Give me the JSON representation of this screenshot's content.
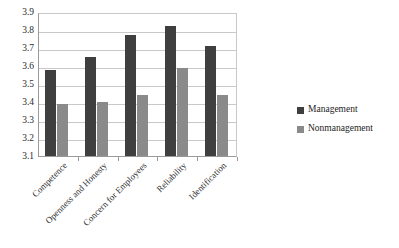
{
  "chart_data": {
    "type": "bar",
    "title": "",
    "subtitle": "",
    "xlabel": "",
    "ylabel": "",
    "ylim": [
      3.1,
      3.9
    ],
    "ytick_step": 0.1,
    "grid": true,
    "legend_position": "right",
    "categories": [
      "Competence",
      "Openness and Honesty",
      "Concern for Employees",
      "Reliability",
      "Identification"
    ],
    "ytick_labels": [
      "3.9",
      "3.8",
      "3.7",
      "3.6",
      "3.5",
      "3.4",
      "3.3",
      "3.2",
      "3.1"
    ],
    "series": [
      {
        "name": "Management",
        "color": "#3f3f3f",
        "values": [
          3.58,
          3.65,
          3.77,
          3.82,
          3.71
        ]
      },
      {
        "name": "Nonmanagement",
        "color": "#8a8a8a",
        "values": [
          3.39,
          3.4,
          3.44,
          3.59,
          3.44
        ]
      }
    ]
  },
  "legend": {
    "items": [
      {
        "label": "Management"
      },
      {
        "label": "Nonmanagement"
      }
    ]
  }
}
